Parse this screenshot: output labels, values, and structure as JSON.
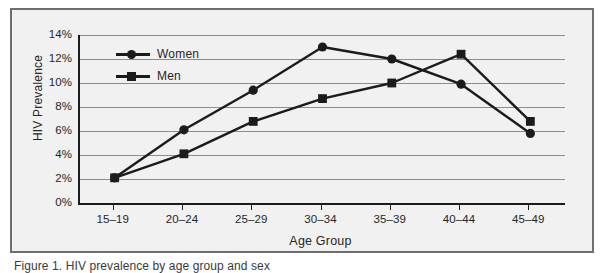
{
  "figure": {
    "background_color": "#f1f1f1",
    "frame_color": "#6e6e6e",
    "axis_color": "#1b1b1b",
    "grid_color": "#8d8d8d",
    "series_color": "#1b1b1b",
    "caption": "Figure 1. HIV prevalence by age group and sex"
  },
  "chart_data": {
    "type": "line",
    "title": "",
    "xlabel": "Age Group",
    "ylabel": "HIV Prevalence",
    "categories": [
      "15–19",
      "20–24",
      "25–29",
      "30–34",
      "35–39",
      "40–44",
      "45–49"
    ],
    "ylim": [
      0,
      14
    ],
    "ytick_labels": [
      "0%",
      "2%",
      "4%",
      "6%",
      "8%",
      "10%",
      "12%",
      "14%"
    ],
    "ytick_values": [
      0,
      2,
      4,
      6,
      8,
      10,
      12,
      14
    ],
    "grid": true,
    "legend_position": "upper-left-inside",
    "series": [
      {
        "name": "Women",
        "marker": "circle",
        "values": [
          2.1,
          6.1,
          9.4,
          13.0,
          12.0,
          9.9,
          5.8
        ]
      },
      {
        "name": "Men",
        "marker": "square",
        "values": [
          2.1,
          4.1,
          6.8,
          8.7,
          10.0,
          12.4,
          6.8
        ]
      }
    ]
  }
}
